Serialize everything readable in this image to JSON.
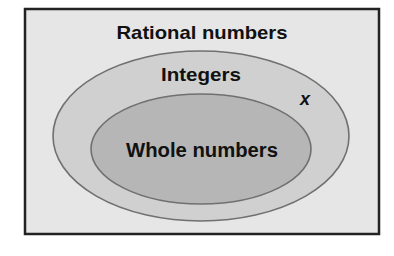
{
  "diagram": {
    "type": "venn-nested",
    "title": "Rational numbers",
    "sets": [
      {
        "id": "rational",
        "label": "Rational numbers",
        "shape": "rectangle",
        "fill": "#e6e6e6",
        "stroke": "#222222"
      },
      {
        "id": "integers",
        "label": "Integers",
        "shape": "ellipse",
        "fill": "#d0d0d0",
        "stroke": "#707070"
      },
      {
        "id": "whole",
        "label": "Whole numbers",
        "shape": "ellipse",
        "fill": "#b6b6b6",
        "stroke": "#707070"
      }
    ],
    "point": {
      "label": "x",
      "region": "integers-not-whole"
    }
  }
}
